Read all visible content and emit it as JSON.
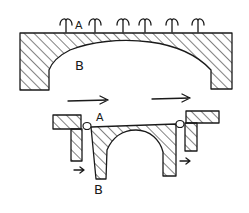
{
  "diagram": {
    "top_figure": {
      "label_top": "A",
      "label_arch": "B",
      "sprout_count": 6
    },
    "bottom_figure": {
      "label_top": "A",
      "label_bottom": "B"
    },
    "colors": {
      "ink": "#1a1a1a",
      "background": "#ffffff"
    }
  }
}
